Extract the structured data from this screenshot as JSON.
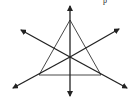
{
  "diagram": {
    "stroke_color": "#222222",
    "triangle": {
      "vertices": [
        [
          70,
          20
        ],
        [
          39,
          75
        ],
        [
          101,
          75
        ]
      ]
    },
    "centroid": [
      70,
      57
    ],
    "lines": [
      {
        "name": "vertical-median",
        "from": [
          70,
          97
        ],
        "to": [
          70,
          5
        ]
      },
      {
        "name": "left-to-upper-right",
        "from": [
          12,
          89
        ],
        "to": [
          120,
          28
        ]
      },
      {
        "name": "right-to-upper-left",
        "from": [
          128,
          89
        ],
        "to": [
          20,
          29
        ]
      }
    ],
    "cut_off_text": "p"
  }
}
